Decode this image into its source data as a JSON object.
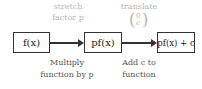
{
  "diagram": {
    "nodes": [
      {
        "id": "f",
        "label": "f(x)"
      },
      {
        "id": "pf",
        "label": "pf(x)"
      },
      {
        "id": "pfc",
        "label": "pf(x) + c"
      }
    ],
    "edges": [
      {
        "from": "f",
        "to": "pf",
        "top_label_1": "stretch",
        "top_label_2": "factor p",
        "bottom_label_1": "Multiply",
        "bottom_label_2": "function by p"
      },
      {
        "from": "pf",
        "to": "pfc",
        "top_label_1": "translate",
        "vector_top": "0",
        "vector_bottom": "c",
        "bottom_label_1": "Add c to",
        "bottom_label_2": "function"
      }
    ]
  }
}
